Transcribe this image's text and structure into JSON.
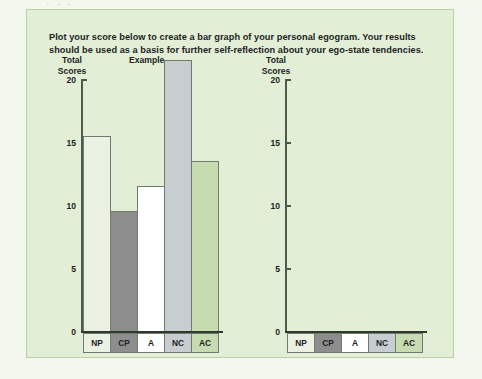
{
  "panel": {
    "intro_text": "Plot your score below to create a bar graph of your personal egogram. Your results should be used as a basis for further self-reflection about your ego-state tendencies.",
    "top_sliver_text": "· - -"
  },
  "colors": {
    "page_background": "#f4f7ee",
    "panel_background": "#e2eed6",
    "panel_border": "#b9d0a4",
    "axis": "#4c5a4a",
    "baseline": "#2f3a2e",
    "bar_outline": "#6f7b6d",
    "bar_np": "#eaf1e2",
    "bar_cp": "#8d8d8d",
    "bar_a": "#ffffff",
    "bar_nc": "#c8cdd2",
    "bar_ac": "#c6dcb0",
    "text": "#221e1f"
  },
  "chart_data": [
    {
      "type": "bar",
      "id": "example",
      "title": "Example",
      "ylabel": "Total Scores",
      "xlabel": "",
      "categories": [
        "NP",
        "CP",
        "A",
        "NC",
        "AC"
      ],
      "values": [
        14,
        8,
        10,
        20,
        12
      ],
      "bar_colors": [
        "#eaf1e2",
        "#8d8d8d",
        "#ffffff",
        "#c8cdd2",
        "#c6dcb0"
      ],
      "ylim": [
        0,
        20
      ],
      "yticks": [
        0,
        5,
        10,
        15,
        20
      ],
      "ytick_labels": [
        "0",
        "5",
        "10",
        "15",
        "20"
      ],
      "grid": false,
      "legend": null
    },
    {
      "type": "bar",
      "id": "your-score",
      "title": "",
      "ylabel": "Total Scores",
      "xlabel": "",
      "categories": [
        "NP",
        "CP",
        "A",
        "NC",
        "AC"
      ],
      "values": [
        0,
        0,
        0,
        0,
        0
      ],
      "bar_colors": [
        "#eaf1e2",
        "#8d8d8d",
        "#ffffff",
        "#c8cdd2",
        "#c6dcb0"
      ],
      "ylim": [
        0,
        20
      ],
      "yticks": [
        0,
        5,
        10,
        15,
        20
      ],
      "ytick_labels": [
        "0",
        "5",
        "10",
        "15",
        "20"
      ],
      "grid": false,
      "legend": null
    }
  ],
  "axis_caption": {
    "line1": "Total",
    "line2": "Scores"
  }
}
